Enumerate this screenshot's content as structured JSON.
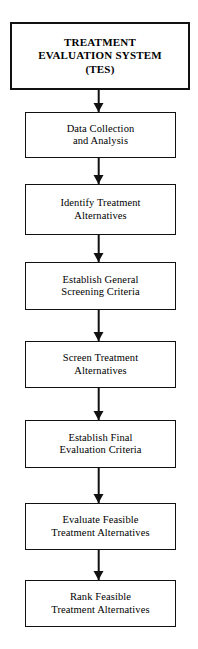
{
  "diagram": {
    "type": "flowchart",
    "orientation": "top-to-bottom",
    "root": {
      "label": "TREATMENT\nEVALUATION SYSTEM\n(TES)"
    },
    "steps": [
      {
        "label": "Data Collection\nand Analysis"
      },
      {
        "label": "Identify Treatment\nAlternatives"
      },
      {
        "label": "Establish General\nScreening Criteria"
      },
      {
        "label": "Screen Treatment\nAlternatives"
      },
      {
        "label": "Establish Final\nEvaluation Criteria"
      },
      {
        "label": "Evaluate Feasible\nTreatment Alternatives"
      },
      {
        "label": "Rank Feasible\nTreatment Alternatives"
      }
    ],
    "connectors": [
      {
        "name": "arrow-root-to-step-1"
      },
      {
        "name": "arrow-step-1-to-step-2"
      },
      {
        "name": "arrow-step-2-to-step-3"
      },
      {
        "name": "arrow-step-3-to-step-4"
      },
      {
        "name": "arrow-step-4-to-step-5"
      },
      {
        "name": "arrow-step-5-to-step-6"
      },
      {
        "name": "arrow-step-6-to-step-7"
      }
    ],
    "colors": {
      "background": "#ffffff",
      "stroke": "#111111",
      "text": "#000000",
      "node_fill": "#ffffff"
    }
  }
}
